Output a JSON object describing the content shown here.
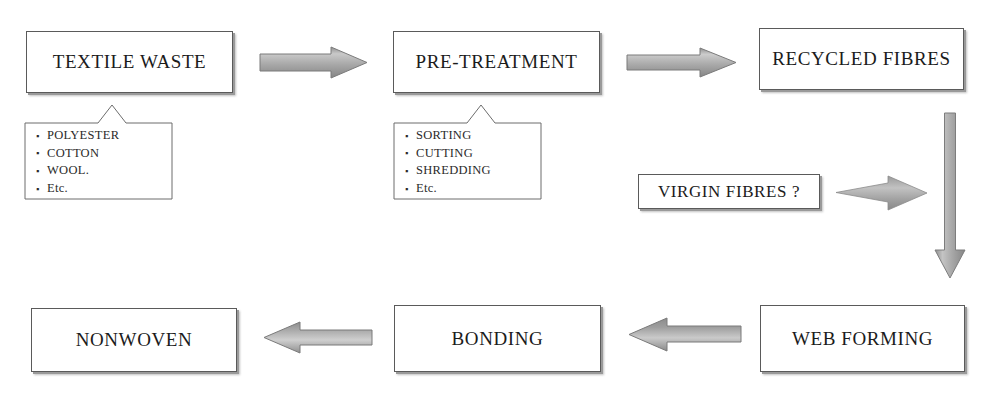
{
  "diagram": {
    "colors": {
      "box_border": "#5a5a5a",
      "box_fill": "#ffffff",
      "box_shadow": "#9a9a9a",
      "arrow_fill_light": "#b4b4b4",
      "arrow_fill_dark": "#8a8a8a",
      "arrow_stroke": "#7a7a7a",
      "text": "#1b1b1b",
      "background": "#ffffff"
    },
    "nodes": [
      {
        "id": "textile-waste",
        "label": "TEXTILE WASTE"
      },
      {
        "id": "pre-treatment",
        "label": "PRE-TREATMENT"
      },
      {
        "id": "recycled-fibres",
        "label": "RECYCLED FIBRES"
      },
      {
        "id": "virgin-fibres",
        "label": "VIRGIN FIBRES ?"
      },
      {
        "id": "web-forming",
        "label": "WEB FORMING"
      },
      {
        "id": "bonding",
        "label": "BONDING"
      },
      {
        "id": "nonwoven",
        "label": "NONWOVEN"
      }
    ],
    "callouts": [
      {
        "id": "textile-waste-note",
        "parent": "textile-waste",
        "items": [
          "POLYESTER",
          "COTTON",
          "WOOL.",
          "Etc."
        ]
      },
      {
        "id": "pre-treatment-note",
        "parent": "pre-treatment",
        "items": [
          "SORTING",
          "CUTTING",
          "SHREDDING",
          "Etc."
        ]
      }
    ],
    "edges": [
      {
        "id": "e1",
        "from": "textile-waste",
        "to": "pre-treatment",
        "direction": "right"
      },
      {
        "id": "e2",
        "from": "pre-treatment",
        "to": "recycled-fibres",
        "direction": "right"
      },
      {
        "id": "e3",
        "from": "virgin-fibres",
        "to": "web-forming",
        "direction": "right"
      },
      {
        "id": "e4",
        "from": "recycled-fibres",
        "to": "web-forming",
        "direction": "down"
      },
      {
        "id": "e5",
        "from": "web-forming",
        "to": "bonding",
        "direction": "left"
      },
      {
        "id": "e6",
        "from": "bonding",
        "to": "nonwoven",
        "direction": "left"
      }
    ]
  }
}
